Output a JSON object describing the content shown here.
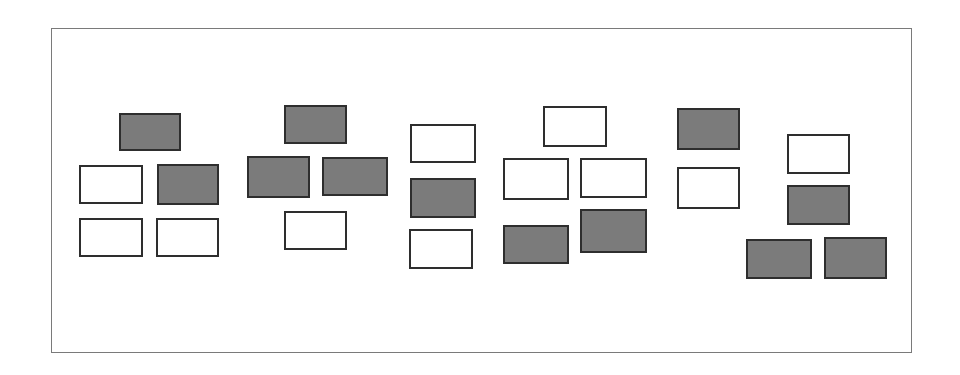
{
  "diagram": {
    "frame": {
      "x": 51,
      "y": 28,
      "w": 861,
      "h": 325,
      "border_color": "#7a7a7a"
    },
    "colors": {
      "filled": "#7b7b7b",
      "empty": "#ffffff",
      "border": "#2e2e2e"
    },
    "groups": [
      {
        "id": "group-1",
        "boxes": [
          {
            "x": 119,
            "y": 113,
            "w": 62,
            "h": 38,
            "filled": true
          },
          {
            "x": 79,
            "y": 165,
            "w": 64,
            "h": 39,
            "filled": false
          },
          {
            "x": 157,
            "y": 164,
            "w": 62,
            "h": 41,
            "filled": true
          },
          {
            "x": 79,
            "y": 218,
            "w": 64,
            "h": 39,
            "filled": false
          },
          {
            "x": 156,
            "y": 218,
            "w": 63,
            "h": 39,
            "filled": false
          }
        ]
      },
      {
        "id": "group-2",
        "boxes": [
          {
            "x": 284,
            "y": 105,
            "w": 63,
            "h": 39,
            "filled": true
          },
          {
            "x": 247,
            "y": 156,
            "w": 63,
            "h": 42,
            "filled": true
          },
          {
            "x": 322,
            "y": 157,
            "w": 66,
            "h": 39,
            "filled": true
          },
          {
            "x": 284,
            "y": 211,
            "w": 63,
            "h": 39,
            "filled": false
          }
        ]
      },
      {
        "id": "group-3",
        "boxes": [
          {
            "x": 410,
            "y": 124,
            "w": 66,
            "h": 39,
            "filled": false
          },
          {
            "x": 410,
            "y": 178,
            "w": 66,
            "h": 40,
            "filled": true
          },
          {
            "x": 409,
            "y": 229,
            "w": 64,
            "h": 40,
            "filled": false
          }
        ]
      },
      {
        "id": "group-4",
        "boxes": [
          {
            "x": 543,
            "y": 106,
            "w": 64,
            "h": 41,
            "filled": false
          },
          {
            "x": 503,
            "y": 158,
            "w": 66,
            "h": 42,
            "filled": false
          },
          {
            "x": 580,
            "y": 158,
            "w": 67,
            "h": 40,
            "filled": false
          },
          {
            "x": 503,
            "y": 225,
            "w": 66,
            "h": 39,
            "filled": true
          },
          {
            "x": 580,
            "y": 209,
            "w": 67,
            "h": 44,
            "filled": true
          }
        ]
      },
      {
        "id": "group-5",
        "boxes": [
          {
            "x": 677,
            "y": 108,
            "w": 63,
            "h": 42,
            "filled": true
          },
          {
            "x": 677,
            "y": 167,
            "w": 63,
            "h": 42,
            "filled": false
          }
        ]
      },
      {
        "id": "group-6",
        "boxes": [
          {
            "x": 787,
            "y": 134,
            "w": 63,
            "h": 40,
            "filled": false
          },
          {
            "x": 787,
            "y": 185,
            "w": 63,
            "h": 40,
            "filled": true
          },
          {
            "x": 746,
            "y": 239,
            "w": 66,
            "h": 40,
            "filled": true
          },
          {
            "x": 824,
            "y": 237,
            "w": 63,
            "h": 42,
            "filled": true
          }
        ]
      }
    ]
  }
}
